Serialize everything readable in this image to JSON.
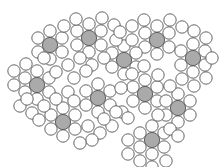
{
  "figure": {
    "background_color": "#ffffff",
    "width": 223,
    "height": 167,
    "large_disk_fill": "#aaaaaa",
    "small_disk_fill": "#fefefe",
    "outline_color": "#545454",
    "outline_width": 0.9,
    "large_disk_radius": 7.6,
    "small_disk_radius": 6.2,
    "large_disk_count": 11,
    "small_disk_count": 121
  },
  "chart_data": {
    "type": "scatter",
    "xlabel": "",
    "ylabel": "",
    "xlim": [
      0,
      223
    ],
    "ylim": [
      0,
      167
    ],
    "grid": false,
    "legend": null,
    "series": [
      {
        "name": "large-gray-disks",
        "marker": "circle",
        "fill": "#aaaaaa",
        "radius": 7.6,
        "points": [
          [
            50,
            45
          ],
          [
            89,
            38
          ],
          [
            157,
            40
          ],
          [
            193,
            58
          ],
          [
            124,
            60
          ],
          [
            37,
            85
          ],
          [
            98,
            98
          ],
          [
            145,
            94
          ],
          [
            178,
            108
          ],
          [
            63,
            122
          ],
          [
            152,
            140
          ]
        ]
      },
      {
        "name": "small-white-disks",
        "marker": "circle",
        "fill": "#fefefe",
        "radius": 6.2,
        "points": [
          [
            50,
            31
          ],
          [
            62,
            38
          ],
          [
            62,
            52
          ],
          [
            50,
            59
          ],
          [
            38,
            52
          ],
          [
            38,
            38
          ],
          [
            89,
            24
          ],
          [
            101,
            31
          ],
          [
            101,
            45
          ],
          [
            89,
            52
          ],
          [
            77,
            45
          ],
          [
            77,
            31
          ],
          [
            157,
            26
          ],
          [
            169,
            33
          ],
          [
            169,
            47
          ],
          [
            157,
            54
          ],
          [
            145,
            47
          ],
          [
            145,
            33
          ],
          [
            193,
            44
          ],
          [
            205,
            51
          ],
          [
            205,
            65
          ],
          [
            193,
            72
          ],
          [
            181,
            65
          ],
          [
            181,
            51
          ],
          [
            124,
            46
          ],
          [
            136,
            53
          ],
          [
            136,
            67
          ],
          [
            124,
            74
          ],
          [
            112,
            67
          ],
          [
            112,
            53
          ],
          [
            37,
            71
          ],
          [
            49,
            78
          ],
          [
            49,
            92
          ],
          [
            37,
            99
          ],
          [
            25,
            92
          ],
          [
            25,
            78
          ],
          [
            98,
            84
          ],
          [
            110,
            91
          ],
          [
            110,
            105
          ],
          [
            98,
            112
          ],
          [
            86,
            105
          ],
          [
            86,
            91
          ],
          [
            145,
            80
          ],
          [
            157,
            87
          ],
          [
            157,
            101
          ],
          [
            145,
            108
          ],
          [
            133,
            101
          ],
          [
            133,
            87
          ],
          [
            178,
            94
          ],
          [
            190,
            101
          ],
          [
            190,
            115
          ],
          [
            178,
            122
          ],
          [
            166,
            115
          ],
          [
            166,
            101
          ],
          [
            63,
            108
          ],
          [
            75,
            115
          ],
          [
            75,
            129
          ],
          [
            63,
            136
          ],
          [
            51,
            129
          ],
          [
            51,
            115
          ],
          [
            152,
            126
          ],
          [
            164,
            133
          ],
          [
            164,
            147
          ],
          [
            152,
            154
          ],
          [
            140,
            147
          ],
          [
            140,
            133
          ],
          [
            64,
            26
          ],
          [
            76,
            19
          ],
          [
            102,
            18
          ],
          [
            114,
            25
          ],
          [
            116,
            40
          ],
          [
            104,
            58
          ],
          [
            92,
            65
          ],
          [
            80,
            58
          ],
          [
            68,
            65
          ],
          [
            56,
            72
          ],
          [
            44,
            58
          ],
          [
            26,
            64
          ],
          [
            14,
            85
          ],
          [
            14,
            71
          ],
          [
            20,
            106
          ],
          [
            32,
            113
          ],
          [
            44,
            106
          ],
          [
            56,
            99
          ],
          [
            68,
            92
          ],
          [
            74,
            78
          ],
          [
            86,
            71
          ],
          [
            74,
            101
          ],
          [
            88,
            126
          ],
          [
            100,
            133
          ],
          [
            112,
            126
          ],
          [
            122,
            112
          ],
          [
            121,
            88
          ],
          [
            132,
            74
          ],
          [
            144,
            66
          ],
          [
            132,
            40
          ],
          [
            144,
            20
          ],
          [
            132,
            26
          ],
          [
            120,
            32
          ],
          [
            170,
            20
          ],
          [
            182,
            27
          ],
          [
            194,
            31
          ],
          [
            206,
            38
          ],
          [
            212,
            58
          ],
          [
            206,
            78
          ],
          [
            194,
            86
          ],
          [
            182,
            79
          ],
          [
            170,
            86
          ],
          [
            158,
            75
          ],
          [
            158,
            115
          ],
          [
            170,
            129
          ],
          [
            178,
            136
          ],
          [
            166,
            161
          ],
          [
            152,
            167
          ],
          [
            140,
            161
          ],
          [
            128,
            154
          ],
          [
            128,
            140
          ],
          [
            128,
            118
          ],
          [
            116,
            112
          ],
          [
            104,
            119
          ],
          [
            92,
            140
          ],
          [
            80,
            143
          ],
          [
            39,
            120
          ],
          [
            27,
            99
          ]
        ]
      }
    ]
  }
}
